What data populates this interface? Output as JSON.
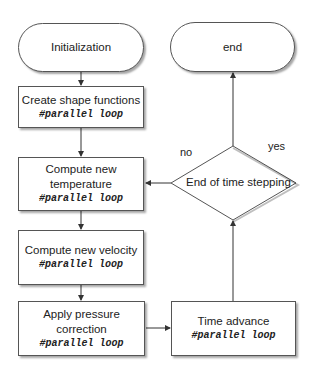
{
  "nodes": {
    "init": {
      "label": "Initialization"
    },
    "shape": {
      "label": "Create shape functions",
      "code": "#parallel loop"
    },
    "temp": {
      "label1": "Compute new",
      "label2": "temperature",
      "code": "#parallel loop"
    },
    "vel": {
      "label": "Compute new velocity",
      "code": "#parallel loop"
    },
    "press": {
      "label": "Apply pressure correction",
      "code": "#parallel loop"
    },
    "time": {
      "label": "Time advance",
      "code": "#parallel loop"
    },
    "end": {
      "label": "end"
    },
    "decision": {
      "label": "End of time stepping"
    }
  },
  "edge_labels": {
    "no": "no",
    "yes": "yes"
  }
}
